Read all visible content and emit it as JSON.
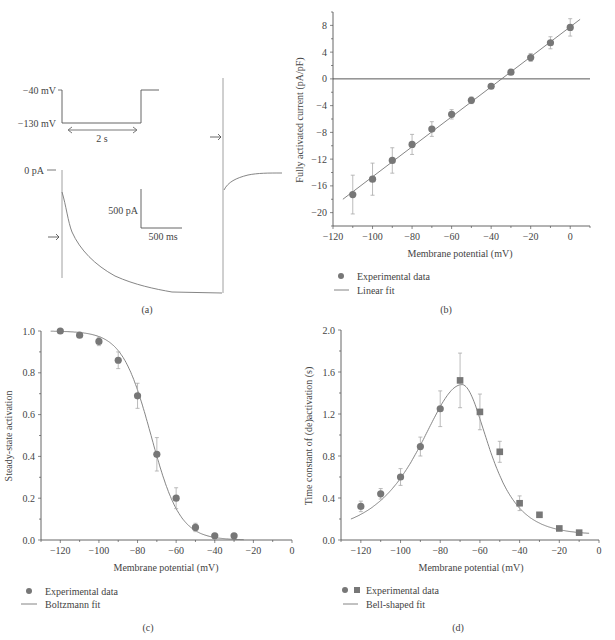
{
  "panels": {
    "a": {
      "caption": "(a)"
    },
    "b": {
      "caption": "(b)"
    },
    "c": {
      "caption": "(c)"
    },
    "d": {
      "caption": "(d)"
    }
  },
  "chart_data": [
    {
      "id": "a",
      "type": "line",
      "title": "Voltage protocol and current trace",
      "labels": {
        "v_high": "−40 mV",
        "v_low": "−130 mV",
        "duration": "2 s",
        "zero_current": "0 pA",
        "scale_current": "500 pA",
        "scale_time": "500 ms"
      },
      "protocol": {
        "holding_mV": -40,
        "step_mV": -130,
        "step_duration_s": 2
      },
      "scale_bar": {
        "current_pA": 500,
        "time_ms": 500
      }
    },
    {
      "id": "b",
      "type": "scatter",
      "title": "",
      "xlabel": "Membrane potential (mV)",
      "ylabel": "Fully activated current (pA/pF)",
      "xlim": [
        -120,
        10
      ],
      "ylim": [
        -22,
        10
      ],
      "xticks": [
        -120,
        -100,
        -80,
        -60,
        -40,
        -20,
        0
      ],
      "yticks": [
        8,
        4,
        0,
        -4,
        -8,
        -12,
        -16,
        -20
      ],
      "zero_line": true,
      "series": [
        {
          "name": "Experimental data",
          "marker": "circle",
          "x": [
            -110,
            -100,
            -90,
            -80,
            -70,
            -60,
            -50,
            -40,
            -30,
            -20,
            -10,
            0
          ],
          "y": [
            -17.3,
            -15.0,
            -12.2,
            -9.8,
            -7.5,
            -5.3,
            -3.2,
            -1.1,
            1.0,
            3.2,
            5.4,
            7.7
          ],
          "err": [
            2.9,
            2.4,
            1.9,
            1.5,
            1.1,
            0.7,
            0.5,
            0.3,
            0.3,
            0.6,
            0.9,
            1.3
          ]
        },
        {
          "name": "Linear fit",
          "type": "line",
          "x": [
            -115,
            5
          ],
          "y": [
            -18.0,
            8.9
          ]
        }
      ],
      "legend": [
        "Experimental data",
        "Linear fit"
      ],
      "legend_position": "bottom-left"
    },
    {
      "id": "c",
      "type": "scatter",
      "title": "",
      "xlabel": "Membrane potential (mV)",
      "ylabel": "Steady-state activation",
      "xlim": [
        -130,
        0
      ],
      "ylim": [
        0,
        1.0
      ],
      "xticks": [
        -120,
        -100,
        -80,
        -60,
        -40,
        -20,
        0
      ],
      "yticks": [
        0.0,
        0.2,
        0.4,
        0.6,
        0.8,
        1.0
      ],
      "series": [
        {
          "name": "Experimental data",
          "marker": "circle",
          "x": [
            -120,
            -110,
            -100,
            -90,
            -80,
            -70,
            -60,
            -50,
            -40,
            -30
          ],
          "y": [
            1.0,
            0.98,
            0.95,
            0.86,
            0.69,
            0.41,
            0.2,
            0.06,
            0.02,
            0.02
          ],
          "err": [
            0,
            0.01,
            0.02,
            0.04,
            0.06,
            0.08,
            0.05,
            0.02,
            0.01,
            0.01
          ]
        },
        {
          "name": "Boltzmann fit",
          "type": "line",
          "v_half": -73,
          "slope": 7.5,
          "x_range": [
            -125,
            -25
          ]
        }
      ],
      "legend": [
        "Experimental data",
        "Boltzmann fit"
      ],
      "legend_position": "bottom-left"
    },
    {
      "id": "d",
      "type": "scatter",
      "title": "",
      "xlabel": "Membrane potential (mV)",
      "ylabel": "Time constant of (de)activation (s)",
      "xlim": [
        -130,
        0
      ],
      "ylim": [
        0,
        2.0
      ],
      "xticks": [
        -120,
        -100,
        -80,
        -60,
        -40,
        -20,
        0
      ],
      "yticks": [
        0.0,
        0.4,
        0.8,
        1.2,
        1.6,
        2.0
      ],
      "series": [
        {
          "name": "Experimental data (activation)",
          "marker": "circle",
          "x": [
            -120,
            -110,
            -100,
            -90,
            -80
          ],
          "y": [
            0.32,
            0.44,
            0.6,
            0.89,
            1.25
          ],
          "err": [
            0.05,
            0.05,
            0.08,
            0.09,
            0.17
          ]
        },
        {
          "name": "Experimental data (deactivation)",
          "marker": "square",
          "x": [
            -70,
            -60,
            -50,
            -40,
            -30,
            -20,
            -10
          ],
          "y": [
            1.52,
            1.22,
            0.84,
            0.35,
            0.24,
            0.11,
            0.07
          ],
          "err": [
            0.26,
            0.17,
            0.1,
            0.07,
            0.02,
            0.01,
            0.01
          ]
        },
        {
          "name": "Bell-shaped fit",
          "type": "line",
          "peak_x": -69,
          "peak_y": 1.48,
          "x_range": [
            -125,
            -5
          ]
        }
      ],
      "legend": [
        "Experimental data",
        "Bell-shaped fit"
      ],
      "legend_position": "bottom-left"
    }
  ]
}
